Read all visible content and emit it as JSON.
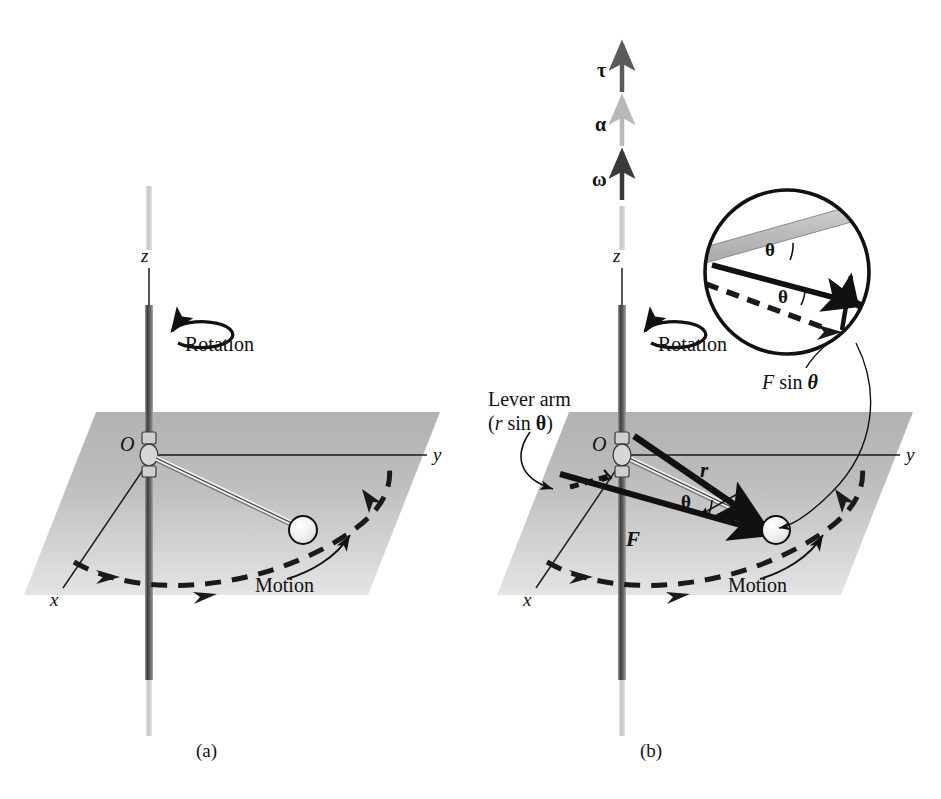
{
  "figure": {
    "panels": [
      {
        "id": "a",
        "caption": "(a)",
        "axes": {
          "x": "x",
          "y": "y",
          "z": "z"
        },
        "labels": {
          "origin": "O",
          "rotation": "Rotation",
          "motion": "Motion"
        }
      },
      {
        "id": "b",
        "caption": "(b)",
        "axes": {
          "x": "x",
          "y": "y",
          "z": "z"
        },
        "labels": {
          "origin": "O",
          "rotation": "Rotation",
          "motion": "Motion",
          "force_vector": "F",
          "position_vector": "r",
          "angle": "θ",
          "lever_arm_line1": "Lever arm",
          "lever_arm_line2": "(r sin θ)",
          "lever_arm_r": "r",
          "lever_arm_sin": "sin",
          "force_component": "F sin θ",
          "force_component_f": "F",
          "force_component_sin": "sin",
          "force_component_theta": "θ"
        },
        "inset": {
          "angle_upper": "θ",
          "angle_lower": "θ"
        },
        "vectors_axis": [
          {
            "symbol": "τ",
            "name": "torque",
            "color": "#555555"
          },
          {
            "symbol": "α",
            "name": "angular-acceleration",
            "color": "#b5b5b5"
          },
          {
            "symbol": "ω",
            "name": "angular-velocity",
            "color": "#3a3a3a"
          }
        ]
      }
    ],
    "colors": {
      "plane_top": "#b4b4b4",
      "plane_bottom": "#dcdcdc",
      "rod_dark": "#4a4a4a",
      "rod_light": "#c9c9c9",
      "stroke": "#111111",
      "dashed": "#1a1a1a",
      "background": "#ffffff"
    }
  }
}
